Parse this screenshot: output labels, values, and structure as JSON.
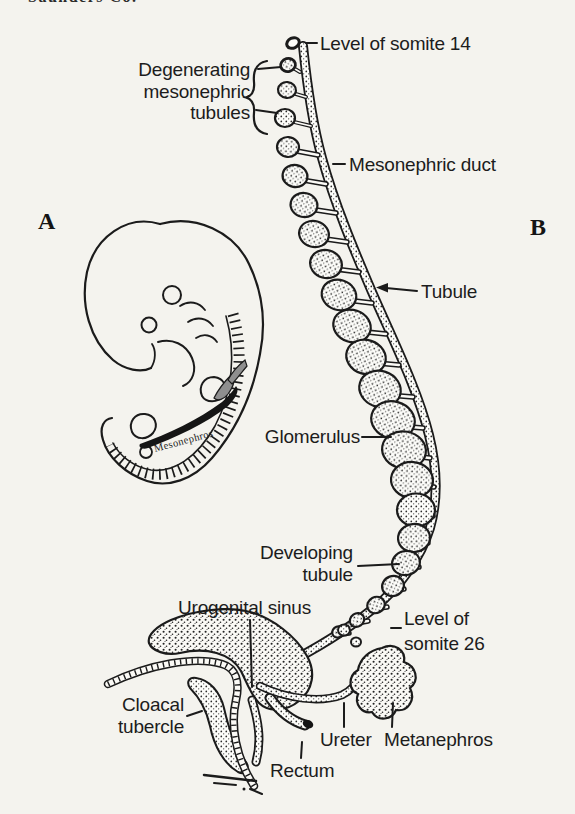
{
  "page": {
    "partial_credit_text": "Saunders Co."
  },
  "figure": {
    "panel_a": "A",
    "panel_b": "B",
    "embryo_inline_label": "Mesonephros",
    "labels": {
      "somite14": "Level of somite 14",
      "degenerating": [
        "Degenerating",
        "mesonephric",
        "tubules"
      ],
      "mesonephric_duct": "Mesonephric duct",
      "tubule": "Tubule",
      "glomerulus": "Glomerulus",
      "developing": [
        "Developing",
        "tubule"
      ],
      "somite26": [
        "Level of",
        "somite 26"
      ],
      "urogenital_sinus": "Urogenital sinus",
      "cloacal": [
        "Cloacal",
        "tubercle"
      ],
      "ureter": "Ureter",
      "metanephros": "Metanephros",
      "rectum": "Rectum"
    },
    "colors": {
      "ink": "#1c1c1c",
      "paper": "#f4f3ee"
    }
  }
}
